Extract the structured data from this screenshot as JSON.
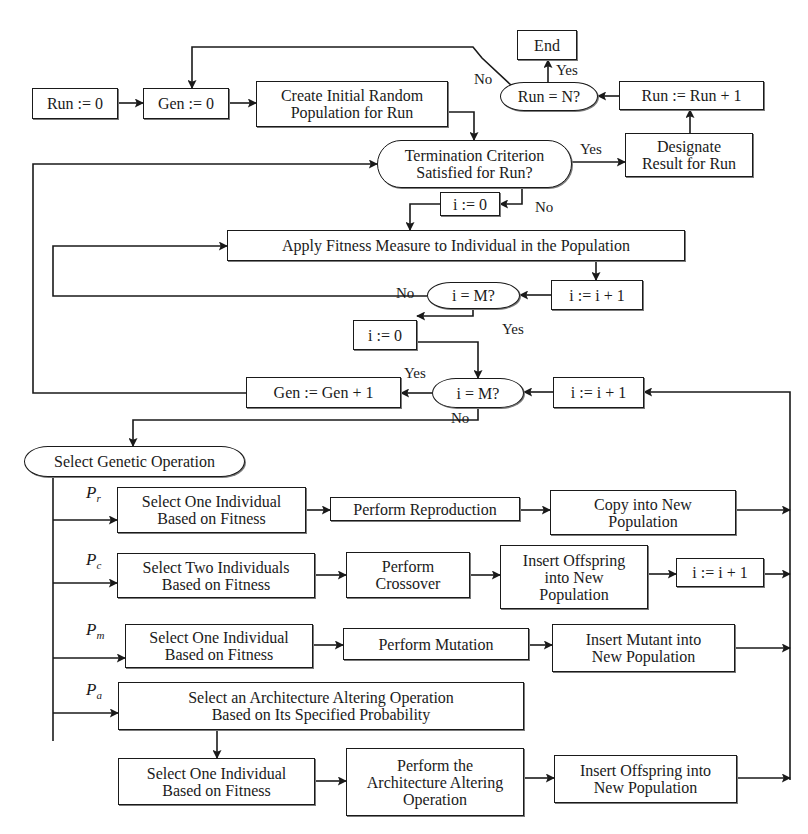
{
  "diagram": {
    "type": "flowchart",
    "stroke_color": "#1a1a1a",
    "background": "#ffffff",
    "nodes": [
      {
        "id": "run0",
        "label": "Run := 0",
        "shape": "rect",
        "x": 32,
        "y": 88,
        "w": 86,
        "h": 31
      },
      {
        "id": "gen0",
        "label": "Gen := 0",
        "shape": "rect",
        "x": 143,
        "y": 88,
        "w": 86,
        "h": 31
      },
      {
        "id": "create",
        "label": "Create Initial Random\nPopulation for Run",
        "shape": "rect",
        "x": 256,
        "y": 81,
        "w": 192,
        "h": 46
      },
      {
        "id": "end",
        "label": "End",
        "shape": "rect",
        "x": 517,
        "y": 30,
        "w": 60,
        "h": 30
      },
      {
        "id": "run_eq_n",
        "label": "Run = N?",
        "shape": "oval",
        "x": 500,
        "y": 82,
        "w": 98,
        "h": 29
      },
      {
        "id": "run_inc",
        "label": "Run := Run + 1",
        "shape": "rect",
        "x": 619,
        "y": 81,
        "w": 145,
        "h": 29
      },
      {
        "id": "term",
        "label": "Termination Criterion\nSatisfied for Run?",
        "shape": "oval",
        "x": 377,
        "y": 140,
        "w": 195,
        "h": 48
      },
      {
        "id": "designate",
        "label": "Designate\nResult for Run",
        "shape": "rect",
        "x": 625,
        "y": 133,
        "w": 128,
        "h": 44
      },
      {
        "id": "i0_a",
        "label": "i := 0",
        "shape": "rect",
        "x": 440,
        "y": 192,
        "w": 60,
        "h": 24
      },
      {
        "id": "apply",
        "label": "Apply Fitness Measure to Individual in the Population",
        "shape": "rect",
        "x": 227,
        "y": 230,
        "w": 458,
        "h": 31
      },
      {
        "id": "i_eq_m_a",
        "label": "i = M?",
        "shape": "oval",
        "x": 427,
        "y": 282,
        "w": 93,
        "h": 27
      },
      {
        "id": "i_inc_a",
        "label": "i := i + 1",
        "shape": "rect",
        "x": 551,
        "y": 280,
        "w": 92,
        "h": 30
      },
      {
        "id": "i0_b",
        "label": "i := 0",
        "shape": "rect",
        "x": 353,
        "y": 320,
        "w": 64,
        "h": 30
      },
      {
        "id": "gen_inc",
        "label": "Gen := Gen + 1",
        "shape": "rect",
        "x": 246,
        "y": 377,
        "w": 155,
        "h": 31
      },
      {
        "id": "i_eq_m_b",
        "label": "i = M?",
        "shape": "oval",
        "x": 432,
        "y": 378,
        "w": 92,
        "h": 30
      },
      {
        "id": "i_inc_b",
        "label": "i := i + 1",
        "shape": "rect",
        "x": 553,
        "y": 377,
        "w": 91,
        "h": 31
      },
      {
        "id": "select_op",
        "label": "Select Genetic Operation",
        "shape": "oval",
        "x": 24,
        "y": 446,
        "w": 221,
        "h": 31
      },
      {
        "id": "r_select",
        "label": "Select One Individual\nBased on Fitness",
        "shape": "rect",
        "x": 117,
        "y": 487,
        "w": 189,
        "h": 46
      },
      {
        "id": "r_perform",
        "label": "Perform Reproduction",
        "shape": "rect",
        "x": 330,
        "y": 497,
        "w": 190,
        "h": 24
      },
      {
        "id": "r_copy",
        "label": "Copy into New\nPopulation",
        "shape": "rect",
        "x": 550,
        "y": 490,
        "w": 186,
        "h": 45
      },
      {
        "id": "c_select",
        "label": "Select Two Individuals\nBased on Fitness",
        "shape": "rect",
        "x": 117,
        "y": 553,
        "w": 198,
        "h": 45
      },
      {
        "id": "c_perform",
        "label": "Perform\nCrossover",
        "shape": "rect",
        "x": 346,
        "y": 552,
        "w": 124,
        "h": 46
      },
      {
        "id": "c_insert",
        "label": "Insert  Offspring\ninto New\nPopulation",
        "shape": "rect",
        "x": 500,
        "y": 545,
        "w": 148,
        "h": 64
      },
      {
        "id": "c_inc",
        "label": "i := i + 1",
        "shape": "rect",
        "x": 676,
        "y": 558,
        "w": 88,
        "h": 29
      },
      {
        "id": "m_select",
        "label": "Select One Individual\nBased on Fitness",
        "shape": "rect",
        "x": 125,
        "y": 624,
        "w": 188,
        "h": 44
      },
      {
        "id": "m_perform",
        "label": "Perform Mutation",
        "shape": "rect",
        "x": 343,
        "y": 628,
        "w": 186,
        "h": 32
      },
      {
        "id": "m_insert",
        "label": "Insert Mutant into\nNew Population",
        "shape": "rect",
        "x": 552,
        "y": 624,
        "w": 183,
        "h": 48
      },
      {
        "id": "a_select_op",
        "label": "Select an Architecture Altering Operation\nBased on Its Specified Probability",
        "shape": "rect",
        "x": 118,
        "y": 682,
        "w": 406,
        "h": 48
      },
      {
        "id": "a_select",
        "label": "Select One Individual\nBased on Fitness",
        "shape": "rect",
        "x": 118,
        "y": 758,
        "w": 197,
        "h": 47
      },
      {
        "id": "a_perform",
        "label": "Perform the\nArchitecture Altering\nOperation",
        "shape": "rect",
        "x": 346,
        "y": 748,
        "w": 178,
        "h": 68
      },
      {
        "id": "a_insert",
        "label": "Insert  Offspring into\nNew Population",
        "shape": "rect",
        "x": 554,
        "y": 755,
        "w": 183,
        "h": 48
      }
    ],
    "edge_labels": [
      {
        "text": "No",
        "x": 474,
        "y": 72
      },
      {
        "text": "Yes",
        "x": 556,
        "y": 63
      },
      {
        "text": "Yes",
        "x": 580,
        "y": 142
      },
      {
        "text": "No",
        "x": 535,
        "y": 200
      },
      {
        "text": "No",
        "x": 396,
        "y": 286
      },
      {
        "text": "Yes",
        "x": 502,
        "y": 322
      },
      {
        "text": "Yes",
        "x": 404,
        "y": 366
      },
      {
        "text": "No",
        "x": 451,
        "y": 411
      }
    ],
    "probabilities": [
      {
        "symbol": "P",
        "sub": "r",
        "x": 86,
        "y": 483
      },
      {
        "symbol": "P",
        "sub": "c",
        "x": 86,
        "y": 550
      },
      {
        "symbol": "P",
        "sub": "m",
        "x": 86,
        "y": 620
      },
      {
        "symbol": "P",
        "sub": "a",
        "x": 86,
        "y": 680
      }
    ],
    "edges": [
      {
        "points": [
          [
            118,
            103
          ],
          [
            143,
            103
          ]
        ],
        "arrow": true
      },
      {
        "points": [
          [
            229,
            103
          ],
          [
            256,
            103
          ]
        ],
        "arrow": true
      },
      {
        "points": [
          [
            448,
            112
          ],
          [
            474,
            112
          ],
          [
            474,
            140
          ]
        ],
        "arrow": true
      },
      {
        "points": [
          [
            572,
            162
          ],
          [
            625,
            162
          ]
        ],
        "arrow": true
      },
      {
        "points": [
          [
            690,
            133
          ],
          [
            690,
            110
          ]
        ],
        "arrow": true
      },
      {
        "points": [
          [
            619,
            96
          ],
          [
            598,
            96
          ]
        ],
        "arrow": true
      },
      {
        "points": [
          [
            548,
            82
          ],
          [
            548,
            60
          ]
        ],
        "arrow": true
      },
      {
        "points": [
          [
            512,
            86
          ],
          [
            482,
            58
          ],
          [
            473,
            47
          ],
          [
            192,
            47
          ],
          [
            192,
            88
          ]
        ],
        "arrow": true
      },
      {
        "points": [
          [
            522,
            188
          ],
          [
            522,
            204
          ],
          [
            500,
            204
          ]
        ],
        "arrow": true
      },
      {
        "points": [
          [
            440,
            204
          ],
          [
            410,
            204
          ],
          [
            410,
            230
          ]
        ],
        "arrow": true
      },
      {
        "points": [
          [
            596,
            261
          ],
          [
            596,
            280
          ]
        ],
        "arrow": true
      },
      {
        "points": [
          [
            551,
            295
          ],
          [
            520,
            295
          ]
        ],
        "arrow": true
      },
      {
        "points": [
          [
            427,
            296
          ],
          [
            53,
            296
          ],
          [
            53,
            246
          ],
          [
            227,
            246
          ]
        ],
        "arrow": true
      },
      {
        "points": [
          [
            473,
            309
          ],
          [
            473,
            316
          ],
          [
            417,
            316
          ]
        ],
        "arrow": true
      },
      {
        "points": [
          [
            417,
            342
          ],
          [
            478,
            342
          ],
          [
            478,
            378
          ]
        ],
        "arrow": true
      },
      {
        "points": [
          [
            553,
            392
          ],
          [
            524,
            392
          ]
        ],
        "arrow": true
      },
      {
        "points": [
          [
            432,
            393
          ],
          [
            401,
            393
          ]
        ],
        "arrow": true
      },
      {
        "points": [
          [
            246,
            393
          ],
          [
            33,
            393
          ],
          [
            33,
            164
          ],
          [
            377,
            164
          ]
        ],
        "arrow": true
      },
      {
        "points": [
          [
            478,
            408
          ],
          [
            478,
            420
          ],
          [
            133,
            420
          ],
          [
            133,
            446
          ]
        ],
        "arrow": true
      },
      {
        "points": [
          [
            790,
            780
          ],
          [
            790,
            392
          ],
          [
            644,
            392
          ]
        ],
        "arrow": true
      },
      {
        "points": [
          [
            53,
            477
          ],
          [
            53,
            741
          ]
        ],
        "arrow": false
      },
      {
        "points": [
          [
            53,
            520
          ],
          [
            117,
            520
          ]
        ],
        "arrow": true
      },
      {
        "points": [
          [
            306,
            510
          ],
          [
            330,
            510
          ]
        ],
        "arrow": true
      },
      {
        "points": [
          [
            520,
            510
          ],
          [
            550,
            510
          ]
        ],
        "arrow": true
      },
      {
        "points": [
          [
            736,
            510
          ],
          [
            790,
            510
          ]
        ],
        "arrow": true
      },
      {
        "points": [
          [
            53,
            583
          ],
          [
            117,
            583
          ]
        ],
        "arrow": true
      },
      {
        "points": [
          [
            315,
            575
          ],
          [
            346,
            575
          ]
        ],
        "arrow": true
      },
      {
        "points": [
          [
            470,
            575
          ],
          [
            500,
            575
          ]
        ],
        "arrow": true
      },
      {
        "points": [
          [
            648,
            574
          ],
          [
            676,
            574
          ]
        ],
        "arrow": true
      },
      {
        "points": [
          [
            764,
            574
          ],
          [
            790,
            574
          ]
        ],
        "arrow": true
      },
      {
        "points": [
          [
            53,
            658
          ],
          [
            125,
            658
          ]
        ],
        "arrow": true
      },
      {
        "points": [
          [
            313,
            645
          ],
          [
            343,
            645
          ]
        ],
        "arrow": true
      },
      {
        "points": [
          [
            529,
            645
          ],
          [
            552,
            645
          ]
        ],
        "arrow": true
      },
      {
        "points": [
          [
            735,
            648
          ],
          [
            790,
            648
          ]
        ],
        "arrow": true
      },
      {
        "points": [
          [
            53,
            713
          ],
          [
            118,
            713
          ]
        ],
        "arrow": true
      },
      {
        "points": [
          [
            217,
            730
          ],
          [
            217,
            758
          ]
        ],
        "arrow": true
      },
      {
        "points": [
          [
            315,
            781
          ],
          [
            346,
            781
          ]
        ],
        "arrow": true
      },
      {
        "points": [
          [
            524,
            778
          ],
          [
            554,
            778
          ]
        ],
        "arrow": true
      },
      {
        "points": [
          [
            737,
            778
          ],
          [
            790,
            778
          ]
        ],
        "arrow": true
      }
    ]
  }
}
